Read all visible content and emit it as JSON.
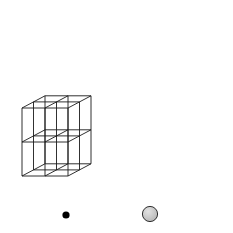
{
  "figure": {
    "projection": "oblique",
    "background_color": "#ffffff",
    "line_color": "#1a1a1a",
    "dashed_bond_color": "#1a1a1a"
  },
  "legend": {
    "items": [
      {
        "id": "cation",
        "icon": "filled-black-circle",
        "label": "Ca",
        "charge": "2+",
        "color": "#111111",
        "radius_px": 3.6
      },
      {
        "id": "anion",
        "icon": "shaded-gray-circle",
        "label": "F",
        "charge": "-",
        "color": "#c9c9c9",
        "outline_color": "#1a1a1a",
        "radius_px": 7.5
      }
    ]
  },
  "chart_data": {
    "type": "scatter",
    "xlabel": "",
    "ylabel": "",
    "grid": false,
    "legend_position": "bottom",
    "projection": {
      "origin_x": 22,
      "origin_y": 176,
      "x_step": 46,
      "y_step": -68,
      "z_step_x": 23,
      "z_step_y": -12.2
    },
    "cube": {
      "nx": 2,
      "ny": 2,
      "nz": 2,
      "edge_color": "#1a1a1a",
      "edge_width": 0.9
    },
    "series": [
      {
        "name": "F-",
        "ion": "F",
        "charge": "-",
        "color": "#c9c9c9",
        "outline": "#1a1a1a",
        "radius_px": 7.5,
        "count": 27,
        "points": [
          {
            "i": 0,
            "j": 0,
            "k": 0
          },
          {
            "i": 1,
            "j": 0,
            "k": 0
          },
          {
            "i": 2,
            "j": 0,
            "k": 0
          },
          {
            "i": 0,
            "j": 0,
            "k": 1
          },
          {
            "i": 1,
            "j": 0,
            "k": 1
          },
          {
            "i": 2,
            "j": 0,
            "k": 1
          },
          {
            "i": 0,
            "j": 0,
            "k": 2
          },
          {
            "i": 1,
            "j": 0,
            "k": 2
          },
          {
            "i": 2,
            "j": 0,
            "k": 2
          },
          {
            "i": 0,
            "j": 1,
            "k": 0
          },
          {
            "i": 1,
            "j": 1,
            "k": 0
          },
          {
            "i": 2,
            "j": 1,
            "k": 0
          },
          {
            "i": 0,
            "j": 1,
            "k": 1
          },
          {
            "i": 1,
            "j": 1,
            "k": 1
          },
          {
            "i": 2,
            "j": 1,
            "k": 1
          },
          {
            "i": 0,
            "j": 1,
            "k": 2
          },
          {
            "i": 1,
            "j": 1,
            "k": 2
          },
          {
            "i": 2,
            "j": 1,
            "k": 2
          },
          {
            "i": 0,
            "j": 2,
            "k": 0
          },
          {
            "i": 1,
            "j": 2,
            "k": 0
          },
          {
            "i": 2,
            "j": 2,
            "k": 0
          },
          {
            "i": 0,
            "j": 2,
            "k": 1
          },
          {
            "i": 1,
            "j": 2,
            "k": 1
          },
          {
            "i": 2,
            "j": 2,
            "k": 1
          },
          {
            "i": 0,
            "j": 2,
            "k": 2
          },
          {
            "i": 1,
            "j": 2,
            "k": 2
          },
          {
            "i": 2,
            "j": 2,
            "k": 2
          }
        ]
      },
      {
        "name": "Ca2+",
        "ion": "Ca",
        "charge": "2+",
        "color": "#111111",
        "radius_px": 3.6,
        "count": 4,
        "points": [
          {
            "x": 93,
            "y": 61,
            "bonded": true
          },
          {
            "x": 140,
            "y": 70,
            "bonded": true
          },
          {
            "x": 72,
            "y": 141,
            "bonded": false
          },
          {
            "x": 163,
            "y": 128,
            "bonded": false
          }
        ]
      }
    ],
    "bonds": {
      "style": "dashed",
      "dash_pattern": "3,2.4",
      "width": 0.85,
      "color": "#1a1a1a",
      "description": "Each bonded Ca2+ is connected to its eight surrounding F- ions",
      "coordination_number": 8
    }
  }
}
